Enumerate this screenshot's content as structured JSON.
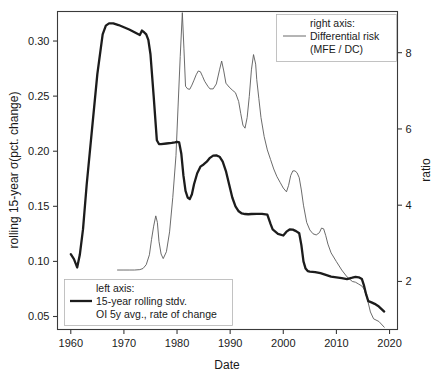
{
  "chart_data": {
    "type": "line",
    "title": "",
    "xlabel": "Date",
    "ylabel_left": "rolling 15-year σ(pct. change)",
    "ylabel_right": "ratio",
    "xlim": [
      1957.5,
      2021.5
    ],
    "ylim_left": [
      0.0382,
      0.3268
    ],
    "ylim_right": [
      0.74,
      9.08
    ],
    "grid": false,
    "xticks": [
      1960,
      1970,
      1980,
      1990,
      2000,
      2010,
      2020
    ],
    "xtick_labels": [
      "1960",
      "1970",
      "1980",
      "1990",
      "2000",
      "2010",
      "2020"
    ],
    "yticks_left": [
      0.05,
      0.1,
      0.15,
      0.2,
      0.25,
      0.3
    ],
    "ytick_labels_left": [
      "0.05",
      "0.10",
      "0.15",
      "0.20",
      "0.25",
      "0.30"
    ],
    "yticks_right": [
      2,
      4,
      6,
      8
    ],
    "ytick_labels_right": [
      "2",
      "4",
      "6",
      "8"
    ],
    "series": [
      {
        "name": "15-year rolling stdv. OI 5y avg., rate of change",
        "axis": "left",
        "color": "#1c1c1c",
        "linewidth": 2.3,
        "legend_position": "lower-left",
        "x": [
          1960.0,
          1960.6,
          1961.2,
          1961.7,
          1962.3,
          1963.0,
          1964.0,
          1965.0,
          1966.0,
          1966.6,
          1967.2,
          1968.0,
          1969.0,
          1970.0,
          1971.0,
          1972.0,
          1973.0,
          1973.4,
          1973.8,
          1974.2,
          1974.6,
          1975.0,
          1975.6,
          1976.2,
          1976.6,
          1977.0,
          1978.0,
          1979.0,
          1979.6,
          1980.0,
          1980.4,
          1980.8,
          1981.2,
          1981.6,
          1982.0,
          1982.4,
          1982.8,
          1983.2,
          1983.8,
          1984.4,
          1985.0,
          1985.6,
          1986.2,
          1986.8,
          1987.4,
          1988.0,
          1988.6,
          1989.2,
          1989.8,
          1990.4,
          1991.0,
          1991.6,
          1992.2,
          1992.8,
          1993.4,
          1994.0,
          1995.0,
          1996.0,
          1997.0,
          1997.6,
          1998.0,
          1999.0,
          2000.0,
          2000.6,
          2001.2,
          2001.8,
          2002.4,
          2003.0,
          2003.4,
          2003.8,
          2004.2,
          2004.6,
          2005.0,
          2006.0,
          2007.0,
          2008.0,
          2009.0,
          2010.0,
          2011.0,
          2012.0,
          2013.0,
          2013.6,
          2014.2,
          2014.8,
          2015.2,
          2015.6,
          2016.0,
          2016.6,
          2017.2,
          2018.0,
          2019.0
        ],
        "y": [
          0.1065,
          0.102,
          0.0945,
          0.106,
          0.129,
          0.17,
          0.22,
          0.27,
          0.306,
          0.314,
          0.316,
          0.316,
          0.3145,
          0.3125,
          0.3105,
          0.308,
          0.3055,
          0.3095,
          0.308,
          0.306,
          0.301,
          0.288,
          0.25,
          0.21,
          0.2065,
          0.2065,
          0.207,
          0.2075,
          0.208,
          0.2085,
          0.208,
          0.198,
          0.178,
          0.164,
          0.158,
          0.1565,
          0.161,
          0.17,
          0.18,
          0.186,
          0.188,
          0.1905,
          0.194,
          0.196,
          0.1962,
          0.195,
          0.1905,
          0.182,
          0.17,
          0.158,
          0.15,
          0.1455,
          0.1435,
          0.143,
          0.1428,
          0.143,
          0.1432,
          0.1432,
          0.1425,
          0.134,
          0.129,
          0.125,
          0.1235,
          0.127,
          0.129,
          0.1288,
          0.1275,
          0.1255,
          0.115,
          0.1,
          0.0935,
          0.0912,
          0.0908,
          0.0903,
          0.0893,
          0.0878,
          0.0862,
          0.0855,
          0.0848,
          0.084,
          0.0852,
          0.086,
          0.0856,
          0.084,
          0.078,
          0.07,
          0.064,
          0.0628,
          0.0615,
          0.059,
          0.0545
        ]
      },
      {
        "name": "Differential risk (MFE / DC)",
        "axis": "right",
        "color": "#5a5a5a",
        "linewidth": 0.9,
        "legend_position": "upper-right",
        "x": [
          1968.8,
          1970.0,
          1971.0,
          1972.0,
          1973.0,
          1973.6,
          1974.2,
          1974.8,
          1975.2,
          1975.6,
          1976.0,
          1976.3,
          1976.6,
          1977.0,
          1977.4,
          1978.0,
          1978.6,
          1979.2,
          1979.8,
          1980.2,
          1980.6,
          1981.0,
          1981.3,
          1981.6,
          1982.0,
          1982.4,
          1982.8,
          1983.2,
          1983.6,
          1984.0,
          1984.4,
          1984.8,
          1985.2,
          1985.8,
          1986.2,
          1986.8,
          1987.4,
          1988.0,
          1988.4,
          1988.8,
          1989.2,
          1989.8,
          1990.4,
          1991.0,
          1991.6,
          1992.0,
          1992.4,
          1992.8,
          1993.2,
          1993.6,
          1994.0,
          1994.4,
          1994.8,
          1995.0,
          1995.4,
          1995.8,
          1996.4,
          1997.0,
          1997.6,
          1998.2,
          1998.8,
          1999.4,
          2000.0,
          2000.6,
          2001.0,
          2001.4,
          2001.8,
          2002.2,
          2002.6,
          2003.0,
          2003.4,
          2003.8,
          2004.4,
          2005.0,
          2005.6,
          2006.2,
          2006.8,
          2007.2,
          2007.6,
          2008.0,
          2008.4,
          2009.0,
          2010.0,
          2011.0,
          2012.0,
          2013.0,
          2013.6,
          2014.2,
          2014.8,
          2015.2,
          2015.8,
          2016.4,
          2017.0,
          2018.0,
          2019.0
        ],
        "y": [
          2.3,
          2.3,
          2.3,
          2.3,
          2.31,
          2.34,
          2.44,
          2.7,
          3.1,
          3.45,
          3.72,
          3.55,
          3.05,
          2.72,
          2.6,
          2.78,
          3.3,
          4.2,
          5.3,
          6.6,
          7.9,
          9.05,
          8.1,
          7.12,
          7.05,
          7.04,
          7.15,
          7.28,
          7.42,
          7.52,
          7.5,
          7.38,
          7.25,
          7.12,
          7.05,
          7.05,
          7.18,
          7.55,
          7.78,
          7.52,
          7.2,
          7.1,
          7.02,
          6.95,
          6.72,
          6.4,
          6.1,
          6.02,
          6.3,
          6.85,
          7.55,
          7.95,
          7.7,
          7.3,
          6.8,
          6.3,
          5.8,
          5.45,
          5.2,
          4.95,
          4.75,
          4.6,
          4.45,
          4.35,
          4.52,
          4.78,
          4.9,
          4.9,
          4.85,
          4.72,
          4.4,
          4.0,
          3.55,
          3.35,
          3.25,
          3.22,
          3.28,
          3.4,
          3.38,
          3.2,
          2.98,
          2.75,
          2.52,
          2.3,
          2.12,
          2.0,
          1.98,
          1.93,
          1.88,
          1.8,
          1.55,
          1.2,
          1.02,
          0.95,
          0.8
        ]
      }
    ],
    "legends": [
      {
        "id": "right-axis-legend",
        "position": "upper-right",
        "header": "right axis:",
        "entry_line1": "Differential risk",
        "entry_line2": "(MFE / DC)",
        "swatch": "thin-line"
      },
      {
        "id": "left-axis-legend",
        "position": "lower-left",
        "header": "left axis:",
        "entry_line1": "15-year rolling stdv.",
        "entry_line2": "OI 5y avg., rate of change",
        "swatch": "bold-line"
      }
    ],
    "colors": {
      "bold_series": "#1c1c1c",
      "thin_series": "#5a5a5a",
      "frame": "#3a3a3a",
      "background": "#ffffff"
    }
  }
}
